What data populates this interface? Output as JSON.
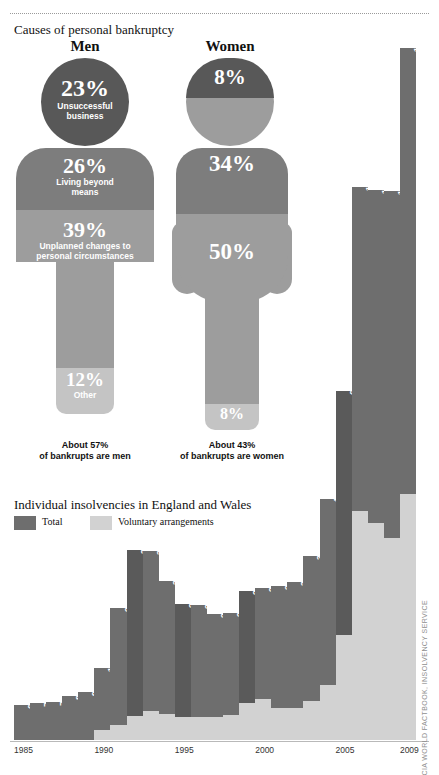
{
  "header": {
    "causes_title": "Causes of personal bankruptcy",
    "insolvency_title": "Individual insolvencies in England and Wales"
  },
  "figures": {
    "men": {
      "label": "Men",
      "note": "About 57%\nof bankrupts are men",
      "note_line1": "About 57%",
      "note_line2": "of bankrupts are men",
      "segments": [
        {
          "pct": "23%",
          "caption": "Unsuccessful business",
          "caption_line1": "Unsuccessful",
          "caption_line2": "business",
          "value": 23,
          "color": "#585858"
        },
        {
          "pct": "26%",
          "caption": "Living beyond means",
          "caption_line1": "Living beyond",
          "caption_line2": "means",
          "value": 26,
          "color": "#7d7d7d"
        },
        {
          "pct": "39%",
          "caption": "Unplanned changes to personal circumstances",
          "caption_line1": "Unplanned changes to",
          "caption_line2": "personal circumstances",
          "value": 39,
          "color": "#9d9d9d"
        },
        {
          "pct": "12%",
          "caption": "Other",
          "caption_line1": "Other",
          "caption_line2": "",
          "value": 12,
          "color": "#c4c4c4"
        }
      ]
    },
    "women": {
      "label": "Women",
      "note_line1": "About 43%",
      "note_line2": "of bankrupts are women",
      "segments": [
        {
          "pct": "8%",
          "caption": "",
          "value": 8,
          "color": "#585858"
        },
        {
          "pct": "34%",
          "caption": "",
          "value": 34,
          "color": "#7d7d7d"
        },
        {
          "pct": "50%",
          "caption": "",
          "value": 50,
          "color": "#9d9d9d"
        },
        {
          "pct": "8%",
          "caption": "",
          "value": 8,
          "color": "#c4c4c4"
        }
      ]
    }
  },
  "legend": {
    "total_label": "Total",
    "total_color": "#6e6e6e",
    "voluntary_label": "Voluntary arrangements",
    "voluntary_color": "#d2d2d2"
  },
  "source": "CIA WORLD FACTBOOK, INSOLVENCY SERVICE",
  "chart_data": {
    "type": "bar",
    "title": "Individual insolvencies in England and Wales",
    "xlabel": "",
    "ylabel": "",
    "ylim": [
      0,
      140000
    ],
    "grid": false,
    "legend_position": "top-left",
    "x": [
      "1985",
      "1986",
      "1987",
      "1988",
      "1989",
      "1990",
      "1991",
      "1992",
      "1993",
      "1994",
      "1995",
      "1996",
      "1997",
      "1998",
      "1999",
      "2000",
      "2001",
      "2002",
      "2003",
      "2004",
      "2005",
      "2006",
      "2007",
      "2008",
      "2009"
    ],
    "tick_labels": [
      "1985",
      "1990",
      "1995",
      "2000",
      "2005",
      "2009"
    ],
    "series": [
      {
        "name": "Total",
        "color": "#6e6e6e",
        "values": [
          6776,
          7155,
          7427,
          8507,
          9365,
          13987,
          25640,
          36794,
          36703,
          30739,
          26319,
          26271,
          24441,
          24549,
          28806,
          29528,
          29775,
          30587,
          35604,
          46650,
          67584,
          107288,
          106645,
          106544,
          134142
        ]
      },
      {
        "name": "Voluntary arrangements",
        "color": "#d2d2d2",
        "values": [
          0,
          0,
          0,
          0,
          0,
          1927,
          3002,
          4686,
          5679,
          5103,
          4385,
          4466,
          4545,
          4901,
          7195,
          7978,
          6298,
          6295,
          7583,
          10752,
          20293,
          44332,
          42165,
          39116,
          47641
        ]
      }
    ],
    "labels": [
      "6,776",
      "7,155",
      "7,427",
      "8,507",
      "9,365",
      "13,987",
      "25,640",
      "36,794",
      "36,703",
      "30,739",
      "26,319",
      "26,271",
      "24,441",
      "24,549",
      "28,806",
      "29,528",
      "29,775",
      "30,587",
      "35,604",
      "46,650",
      "67,584",
      "107,288",
      "106,645",
      "106,544",
      "134,142"
    ]
  }
}
